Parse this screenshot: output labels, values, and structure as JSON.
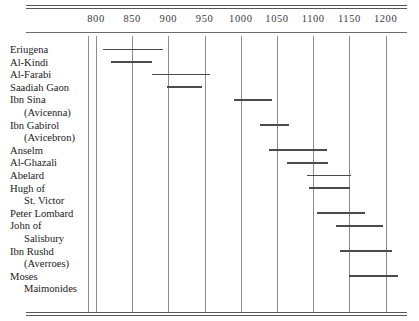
{
  "chart_data": {
    "type": "bar",
    "orientation": "horizontal",
    "title": "",
    "subtitle": "",
    "xlabel": "",
    "ylabel": "",
    "xlim": [
      775,
      1215
    ],
    "grid": true,
    "legend": false,
    "axis_position": "top",
    "xticks": [
      800,
      850,
      900,
      950,
      1000,
      1050,
      1100,
      1150,
      1200
    ],
    "xtick_labels": [
      "800",
      "850",
      "900",
      "950",
      "1000",
      "1050",
      "1100",
      "1150",
      "1200"
    ],
    "categories": [
      "Eriugena",
      "Al-Kindi",
      "Al-Farabi",
      "Saadiah Gaon",
      "Ibn Sina (Avicenna)",
      "Ibn Gabirol (Avicebron)",
      "Anselm",
      "Al-Ghazali",
      "Abelard",
      "Hugh of St. Victor",
      "Peter Lombard",
      "John of Salisbury",
      "Ibn Rushd (Averroes)",
      "Moses Maimonides"
    ],
    "bars": [
      {
        "label_lines": [
          "Eriugena"
        ],
        "start": 810,
        "end": 893
      },
      {
        "label_lines": [
          "Al-Kindi"
        ],
        "start": 821,
        "end": 877
      },
      {
        "label_lines": [
          "Al-Farabi"
        ],
        "start": 877,
        "end": 958
      },
      {
        "label_lines": [
          "Saadiah Gaon"
        ],
        "start": 898,
        "end": 946
      },
      {
        "label_lines": [
          "Ibn Sina",
          "(Avicenna)"
        ],
        "start": 990,
        "end": 1043
      },
      {
        "label_lines": [
          "Ibn Gabirol",
          "(Avicebron)"
        ],
        "start": 1027,
        "end": 1067
      },
      {
        "label_lines": [
          "Anselm"
        ],
        "start": 1039,
        "end": 1119
      },
      {
        "label_lines": [
          "Al-Ghazali"
        ],
        "start": 1064,
        "end": 1120
      },
      {
        "label_lines": [
          "Abelard"
        ],
        "start": 1091,
        "end": 1152
      },
      {
        "label_lines": [
          "Hugh of",
          "St. Victor"
        ],
        "start": 1094,
        "end": 1151
      },
      {
        "label_lines": [
          "Peter Lombard"
        ],
        "start": 1105,
        "end": 1172
      },
      {
        "label_lines": [
          "John of",
          "Salisbury"
        ],
        "start": 1131,
        "end": 1196
      },
      {
        "label_lines": [
          "Ibn Rushd",
          "(Averroes)"
        ],
        "start": 1137,
        "end": 1209
      },
      {
        "label_lines": [
          "Moses",
          "Maimonides"
        ],
        "start": 1150,
        "end": 1217
      }
    ]
  },
  "colors": {
    "bar": "#4a4a50",
    "gridline": "#8a8a90",
    "rule": "#56565c",
    "text": "#1a1a1a",
    "background": "#ffffff"
  }
}
